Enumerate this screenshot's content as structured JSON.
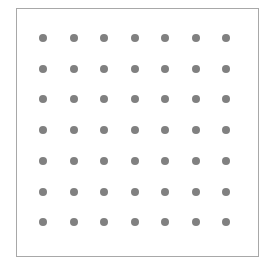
{
  "grid": {
    "rows": 7,
    "cols": 7,
    "dot_color": "#808080",
    "border_color": "#a8a8a8",
    "origin": {
      "x": 43,
      "y": 38
    },
    "spacing": {
      "x": 30.5,
      "y": 30.7
    },
    "dot_diameter": 8
  }
}
